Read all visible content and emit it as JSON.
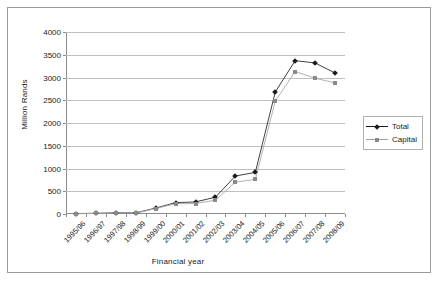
{
  "chart_data": {
    "type": "line",
    "title": "",
    "xlabel": "Financial year",
    "ylabel": "Million Rands",
    "ylim": [
      0,
      4000
    ],
    "yticks": [
      0,
      500,
      1000,
      1500,
      2000,
      2500,
      3000,
      3500,
      4000
    ],
    "ytick_labels": [
      "0",
      "500",
      "1000",
      "1500",
      "2000",
      "2500",
      "3000",
      "3500",
      "4000"
    ],
    "grid": true,
    "legend_position": "right",
    "categories": [
      "1995/96",
      "1996/97",
      "1997/98",
      "1998/99",
      "1999/00",
      "2000/01",
      "2001/02",
      "2002/03",
      "2003/04",
      "2004/05",
      "2005/06",
      "2006/07",
      "2007/08",
      "2008/09"
    ],
    "series": [
      {
        "name": "Total",
        "marker": "diamond",
        "color": "#1a1a1a",
        "values": [
          10,
          15,
          25,
          25,
          130,
          250,
          265,
          370,
          835,
          915,
          2680,
          3370,
          3320,
          3100
        ]
      },
      {
        "name": "Capital",
        "marker": "square",
        "color": "#8a8a8a",
        "values": [
          8,
          12,
          20,
          20,
          120,
          225,
          230,
          305,
          700,
          760,
          2480,
          3130,
          2985,
          2880
        ]
      }
    ]
  },
  "legend": {
    "items": [
      {
        "label": "Total"
      },
      {
        "label": "Capital"
      }
    ]
  }
}
